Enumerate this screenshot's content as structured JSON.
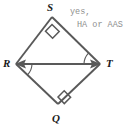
{
  "figure": {
    "stroke_color": "#595959",
    "label_color": "#1a1a1a",
    "answer_color": "#8e8e8e",
    "background_color": "#ffffff",
    "vertices": [
      {
        "name": "S",
        "label": "S",
        "x": 52,
        "y": 17,
        "position": "top"
      },
      {
        "name": "R",
        "label": "R",
        "x": 16,
        "y": 64,
        "position": "left"
      },
      {
        "name": "T",
        "label": "T",
        "x": 100,
        "y": 64,
        "position": "right"
      },
      {
        "name": "Q",
        "label": "Q",
        "x": 58,
        "y": 104,
        "position": "bottom"
      }
    ],
    "segments": [
      {
        "name": "segment-RS",
        "from": "R",
        "to": "S"
      },
      {
        "name": "segment-ST",
        "from": "S",
        "to": "T"
      },
      {
        "name": "segment-TQ",
        "from": "T",
        "to": "Q"
      },
      {
        "name": "segment-QR",
        "from": "Q",
        "to": "R"
      },
      {
        "name": "diagonal-RT",
        "from": "R",
        "to": "T",
        "arrows": "both"
      }
    ],
    "angle_marks": [
      {
        "name": "right-angle-S",
        "vertex": "S",
        "type": "right-angle-square"
      },
      {
        "name": "right-angle-Q",
        "vertex": "Q",
        "type": "right-angle-square"
      },
      {
        "name": "angle-arc-T",
        "vertex": "T",
        "type": "arc",
        "between": "TS and TR"
      },
      {
        "name": "angle-arc-R",
        "vertex": "R",
        "type": "arc",
        "between": "RT and RQ"
      }
    ]
  },
  "answer": {
    "line1": "yes,",
    "line2": "HA or AAS"
  }
}
